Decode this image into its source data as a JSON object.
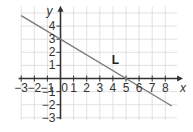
{
  "chart_data": {
    "type": "line",
    "title": "",
    "xlabel": "x",
    "ylabel": "y",
    "xlim": [
      -3,
      9
    ],
    "ylim": [
      -3,
      5.5
    ],
    "grid": true,
    "x_ticks": [
      -3,
      -2,
      -1,
      0,
      1,
      2,
      3,
      4,
      5,
      6,
      7,
      8
    ],
    "x_tick_labels": [
      "−3",
      "−2",
      "−1",
      "0",
      "1",
      "2",
      "3",
      "4",
      "5",
      "6",
      "7",
      "8"
    ],
    "y_ticks": [
      -3,
      -2,
      -1,
      1,
      2,
      3,
      4
    ],
    "y_tick_labels": [
      "−3",
      "−2",
      "−1",
      "1",
      "2",
      "3",
      "4"
    ],
    "series": [
      {
        "name": "L",
        "label": "L",
        "color": "#7a7a7a",
        "x": [
          -3,
          8.5
        ],
        "y": [
          4.8,
          -2.1
        ],
        "equation": "y = -0.6x + 3",
        "intercepts": {
          "y": 3,
          "x": 5
        }
      }
    ],
    "annotations": [
      {
        "text": "L",
        "x": 4.2,
        "y": 1.1
      }
    ],
    "colors": {
      "grid": "#d9d9d9",
      "axis": "#333333"
    }
  }
}
